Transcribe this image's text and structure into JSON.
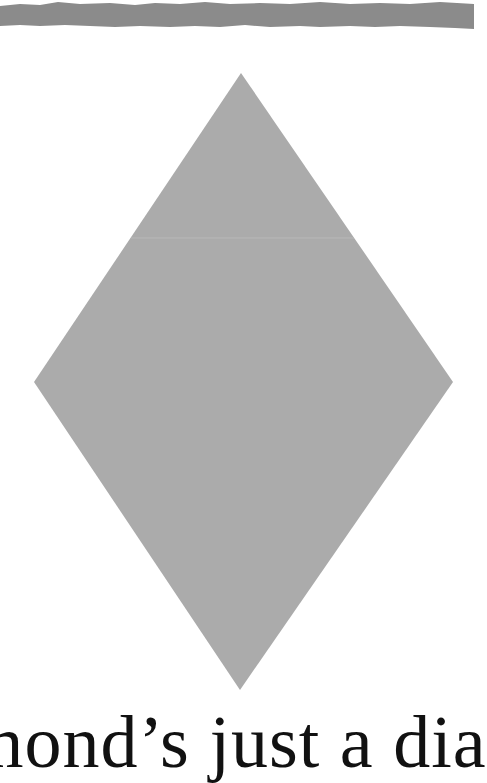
{
  "band": {
    "color": "#8b8b8b"
  },
  "diamond": {
    "fill": "#ababab",
    "seam_color": "#b8b8b8",
    "points": {
      "top": [
        241,
        73
      ],
      "right": [
        453,
        382
      ],
      "bottom": [
        240,
        690
      ],
      "left": [
        34,
        382
      ]
    },
    "seam_y": 238
  },
  "caption": {
    "text": "mond’s just a dia"
  }
}
